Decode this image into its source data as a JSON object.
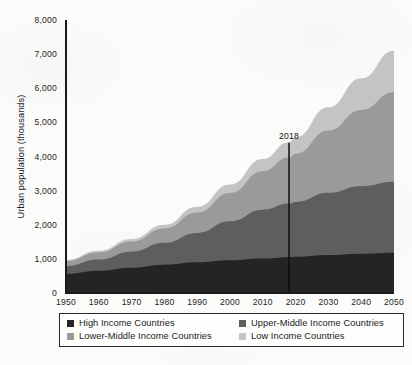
{
  "chart_data": {
    "type": "area",
    "title": "",
    "xlabel": "",
    "ylabel": "Urban population (thousands)",
    "xlim": [
      1950,
      2050
    ],
    "ylim": [
      0,
      8000
    ],
    "grid": false,
    "stacked": true,
    "legend_position": "bottom",
    "x": [
      1950,
      1960,
      1970,
      1980,
      1990,
      2000,
      2010,
      2018,
      2020,
      2030,
      2040,
      2050
    ],
    "xtick_labels": [
      "1950",
      "1960",
      "1970",
      "1980",
      "1990",
      "2000",
      "2010",
      "2020",
      "2030",
      "2040",
      "2050"
    ],
    "xticks": [
      1950,
      1960,
      1970,
      1980,
      1990,
      2000,
      2010,
      2020,
      2030,
      2040,
      2050
    ],
    "ytick_labels": [
      "0",
      "1,000",
      "2,000",
      "3,000",
      "4,000",
      "5,000",
      "6,000",
      "7,000",
      "8,000"
    ],
    "yticks": [
      0,
      1000,
      2000,
      3000,
      4000,
      5000,
      6000,
      7000,
      8000
    ],
    "series": [
      {
        "name": "High Income Countries",
        "color": "#242424",
        "values": [
          560,
          650,
          740,
          830,
          900,
          960,
          1010,
          1050,
          1060,
          1110,
          1150,
          1180
        ]
      },
      {
        "name": "Upper-Middle Income Countries",
        "color": "#5e5e5e",
        "values": [
          230,
          330,
          470,
          640,
          860,
          1140,
          1430,
          1570,
          1610,
          1830,
          1980,
          2080
        ]
      },
      {
        "name": "Lower-Middle Income Countries",
        "color": "#9a9a9a",
        "values": [
          150,
          210,
          300,
          420,
          600,
          830,
          1130,
          1350,
          1410,
          1820,
          2230,
          2620
        ]
      },
      {
        "name": "Low Income Countries",
        "color": "#c4c4c4",
        "values": [
          30,
          45,
          70,
          110,
          170,
          250,
          360,
          450,
          480,
          680,
          930,
          1220
        ]
      }
    ],
    "annotations": [
      {
        "label": "2018",
        "x": 2018,
        "y_top": 4400
      }
    ]
  },
  "legend": {
    "items": [
      {
        "label": "High Income Countries",
        "color": "#242424"
      },
      {
        "label": "Upper-Middle Income Countries",
        "color": "#5e5e5e"
      },
      {
        "label": "Lower-Middle Income Countries",
        "color": "#9a9a9a"
      },
      {
        "label": "Low Income Countries",
        "color": "#c4c4c4"
      }
    ]
  }
}
